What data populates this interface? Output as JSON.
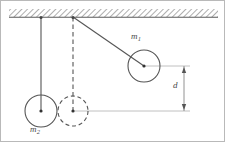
{
  "figure": {
    "background_color": "#ffffff",
    "border_color": "#b9b9b9",
    "line_color": "#555555",
    "guide_color": "#aaaaaa",
    "hatch_color": "#999999",
    "labels": {
      "mass_one": "m",
      "mass_one_subscript": "1",
      "mass_two": "m",
      "mass_two_subscript": "2",
      "distance": "d"
    },
    "ceiling": {
      "name": "hatched ceiling",
      "x": 8,
      "y": 8,
      "width": 209,
      "height": 8
    },
    "anchors": [
      {
        "name": "anchor-left",
        "x": 40,
        "y": 16
      },
      {
        "name": "anchor-right",
        "x": 72,
        "y": 16
      }
    ],
    "strings": [
      {
        "name": "string-m2",
        "style": "solid",
        "x1": 40,
        "y1": 16,
        "x2": 40,
        "y2": 110
      },
      {
        "name": "string-reference",
        "style": "dashed",
        "x1": 72,
        "y1": 16,
        "x2": 72,
        "y2": 110
      },
      {
        "name": "string-m1",
        "style": "solid",
        "x1": 72,
        "y1": 16,
        "x2": 143,
        "y2": 65
      }
    ],
    "bodies": [
      {
        "name": "mass-one-circle",
        "style": "solid",
        "cx": 143,
        "cy": 65,
        "r": 16
      },
      {
        "name": "mass-two-circle",
        "style": "solid",
        "cx": 40,
        "cy": 110,
        "r": 16
      },
      {
        "name": "reference-circle",
        "style": "dashed",
        "cx": 72,
        "cy": 110,
        "r": 15
      }
    ],
    "guides": [
      {
        "name": "guide-upper",
        "x1": 143,
        "y1": 65,
        "x2": 189,
        "y2": 65
      },
      {
        "name": "guide-lower",
        "x1": 72,
        "y1": 110,
        "x2": 189,
        "y2": 110
      }
    ],
    "dimension": {
      "name": "distance-d",
      "x": 183,
      "y_top": 65,
      "y_bottom": 110,
      "value_label": "d"
    }
  }
}
